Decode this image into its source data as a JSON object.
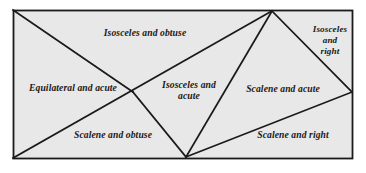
{
  "figure": {
    "canvas": {
      "width": 366,
      "height": 173
    },
    "colors": {
      "page_background": "#ffffff",
      "panel_fill": "#e8e8e8",
      "panel_border": "#1a1a1a",
      "line": "#1a1a1a",
      "text": "#191919"
    },
    "panel": {
      "x": 13,
      "y": 10,
      "width": 340,
      "height": 149
    },
    "vertices": {
      "top_left": [
        13,
        10
      ],
      "top_right": [
        353,
        10
      ],
      "bottom_left": [
        13,
        159
      ],
      "bottom_right": [
        353,
        159
      ],
      "apex_top": [
        272,
        11
      ],
      "apex_bottom": [
        186,
        157
      ],
      "node_center_left": [
        133,
        92
      ],
      "node_right_edge": [
        352,
        92
      ]
    },
    "segments": [
      {
        "name": "tl-to-center",
        "from": [
          13,
          10
        ],
        "to": [
          133,
          92
        ]
      },
      {
        "name": "center-to-apex-bottom",
        "from": [
          133,
          92
        ],
        "to": [
          186,
          157
        ]
      },
      {
        "name": "bl-to-apex-top",
        "from": [
          13,
          158
        ],
        "to": [
          272,
          11
        ]
      },
      {
        "name": "apex-top-to-apex-bottom",
        "from": [
          272,
          11
        ],
        "to": [
          186,
          157
        ]
      },
      {
        "name": "apex-top-to-right-edge",
        "from": [
          272,
          11
        ],
        "to": [
          352,
          92
        ]
      },
      {
        "name": "right-edge-to-apex-bottom",
        "from": [
          352,
          92
        ],
        "to": [
          186,
          157
        ]
      }
    ],
    "regions": [
      {
        "id": "isosceles-obtuse",
        "lines": [
          "Isosceles and obtuse"
        ],
        "x": 85,
        "y": 27,
        "width": 120,
        "align": "center",
        "size": "sz-10"
      },
      {
        "id": "isosceles-right",
        "lines": [
          "Isosceles",
          "and",
          "right"
        ],
        "x": 301,
        "y": 24,
        "width": 58,
        "align": "center",
        "size": "sz-9"
      },
      {
        "id": "equilateral-acute",
        "lines": [
          "Equilateral and acute"
        ],
        "x": 14,
        "y": 82,
        "width": 118,
        "align": "center",
        "size": "sz-10"
      },
      {
        "id": "isosceles-acute",
        "lines": [
          "Isosceles and",
          "acute"
        ],
        "x": 150,
        "y": 79,
        "width": 78,
        "align": "center",
        "size": "sz-10"
      },
      {
        "id": "scalene-acute",
        "lines": [
          "Scalene and acute"
        ],
        "x": 232,
        "y": 83,
        "width": 102,
        "align": "center",
        "size": "sz-10"
      },
      {
        "id": "scalene-obtuse",
        "lines": [
          "Scalene and obtuse"
        ],
        "x": 57,
        "y": 129,
        "width": 112,
        "align": "center",
        "size": "sz-10"
      },
      {
        "id": "scalene-right",
        "lines": [
          "Scalene and right"
        ],
        "x": 242,
        "y": 129,
        "width": 102,
        "align": "center",
        "size": "sz-10"
      }
    ]
  }
}
